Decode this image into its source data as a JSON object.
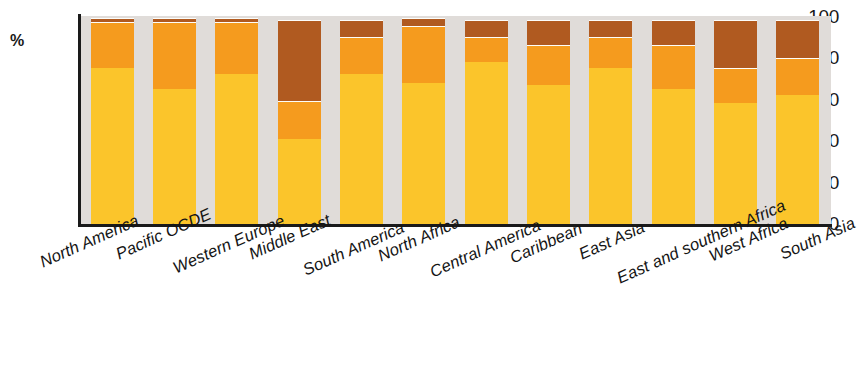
{
  "chart_data": {
    "type": "bar",
    "stacked": true,
    "title": "",
    "subtitle": "",
    "xlabel": "",
    "ylabel": "%",
    "ylim": [
      0,
      100
    ],
    "yticks": [
      0,
      20,
      40,
      60,
      80,
      100
    ],
    "ytick_labels": [
      "0",
      "20",
      "40",
      "60",
      "80",
      "100"
    ],
    "grid": false,
    "legend": "none",
    "categories": [
      "North America",
      "Pacific OCDE",
      "Western Europe",
      "Middle East",
      "South America",
      "North Africa",
      "Central America",
      "Caribbean",
      "East Asia",
      "East and southern Africa",
      "West Africa",
      "South Asia"
    ],
    "series": [
      {
        "name": "yellow-segment",
        "color": "#fbc52b",
        "values": [
          75,
          65,
          72,
          41,
          72,
          68,
          78,
          67,
          75,
          65,
          58,
          62
        ]
      },
      {
        "name": "orange-segment",
        "color": "#f59b1e",
        "values": [
          22,
          32,
          25,
          18,
          18,
          27,
          12,
          19,
          15,
          21,
          17,
          18
        ]
      },
      {
        "name": "brown-segment",
        "color": "#b05a20",
        "values": [
          2,
          2,
          2,
          39,
          8,
          4,
          8,
          12,
          8,
          12,
          23,
          18
        ]
      }
    ],
    "colors": {
      "plot_background": "#e0dcd9",
      "axis": "#1a1a1a",
      "page_background": "#ffffff",
      "segment_divider": "#fdfdfa"
    }
  }
}
